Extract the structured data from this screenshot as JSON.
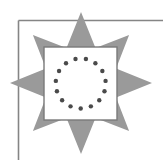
{
  "figure": {
    "colors": {
      "background": "#ffffff",
      "star": "#9a9a9a",
      "frame_line": "#858585",
      "square_fill": "#ffffff",
      "square_stroke": "#7a7a7a",
      "dots": "#4a4a4a"
    },
    "star": {
      "points": 8,
      "center": [
        81,
        83
      ],
      "outer_radius_axial": 71,
      "outer_radius_diagonal": 68,
      "inner_radius": 38
    },
    "square": {
      "x": 44,
      "y": 47,
      "width": 73,
      "height": 73
    },
    "dot_ring": {
      "count": 15,
      "center": [
        80.7,
        83.5
      ],
      "radius": 25,
      "dot_radius": 2.2
    },
    "frame": {
      "top_y": 20.5,
      "left_x": 18.5
    }
  }
}
